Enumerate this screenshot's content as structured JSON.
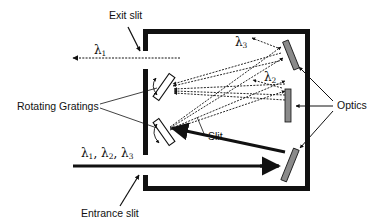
{
  "diagram": {
    "type": "optical-schematic",
    "labels": {
      "exit_slit": "Exit slit",
      "entrance_slit": "Entrance slit",
      "rotating_gratings": "Rotating Gratings",
      "optics": "Optics",
      "slit": "Slit"
    },
    "wavelengths": {
      "symbol": "λ",
      "input": [
        {
          "symbol": "λ",
          "sub": "1"
        },
        {
          "symbol": "λ",
          "sub": "2"
        },
        {
          "symbol": "λ",
          "sub": "3"
        }
      ],
      "input_separator": ", ",
      "exit": {
        "symbol": "λ",
        "sub": "1"
      },
      "mirror_2": {
        "symbol": "λ",
        "sub": "2"
      },
      "mirror_3": {
        "symbol": "λ",
        "sub": "3"
      }
    },
    "colors": {
      "wall": "#111111",
      "mirror_fill": "#8a8a8a",
      "grating_fill": "#ffffff",
      "ray": "#111111",
      "background": "#ffffff"
    }
  }
}
